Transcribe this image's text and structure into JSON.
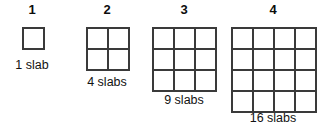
{
  "diagram": {
    "type": "growing-square-pattern",
    "background_color": "#ffffff",
    "line_color": "#3a3a3a",
    "text_color": "#111111",
    "cell_size_px": 21,
    "figures": [
      {
        "step_number": "1",
        "rows": 1,
        "cols": 1,
        "cell_count": 1,
        "slab_label": "1 slab",
        "grid_left": 22,
        "grid_top": 27,
        "number_center_x": 32,
        "label_center_x": 32,
        "label_top": 58
      },
      {
        "step_number": "2",
        "rows": 2,
        "cols": 2,
        "cell_count": 4,
        "slab_label": "4 slabs",
        "grid_left": 86,
        "grid_top": 27,
        "number_center_x": 107,
        "label_center_x": 107,
        "label_top": 75
      },
      {
        "step_number": "3",
        "rows": 3,
        "cols": 3,
        "cell_count": 9,
        "slab_label": "9 slabs",
        "grid_left": 152,
        "grid_top": 27,
        "number_center_x": 184,
        "label_center_x": 184,
        "label_top": 93
      },
      {
        "step_number": "4",
        "rows": 4,
        "cols": 4,
        "cell_count": 16,
        "slab_label": "16 slabs",
        "grid_left": 231,
        "grid_top": 27,
        "number_center_x": 273,
        "label_center_x": 273,
        "label_top": 111
      }
    ]
  }
}
